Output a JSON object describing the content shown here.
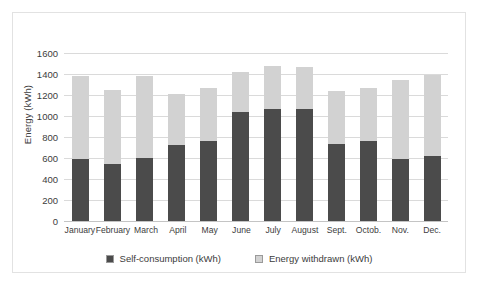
{
  "chart_data": {
    "type": "bar",
    "stacked": true,
    "title": "",
    "xlabel": "",
    "ylabel": "Energy (kWh)",
    "ylim": [
      0,
      1600
    ],
    "ytick_step": 200,
    "yticks": [
      1600,
      1400,
      1200,
      1000,
      800,
      600,
      400,
      200,
      0
    ],
    "grid": "horizontal",
    "legend_position": "bottom",
    "categories": [
      "January",
      "February",
      "March",
      "April",
      "May",
      "June",
      "July",
      "August",
      "Sept.",
      "Octob.",
      "Nov.",
      "Dec."
    ],
    "series": [
      {
        "name": "Self-consumption (kWh)",
        "color": "#4b4b4b",
        "values": [
          590,
          540,
          600,
          720,
          760,
          1040,
          1070,
          1065,
          730,
          760,
          590,
          620
        ]
      },
      {
        "name": "Energy withdrawn (kWh)",
        "color": "#d2d2d2",
        "values": [
          790,
          705,
          785,
          490,
          505,
          380,
          405,
          405,
          510,
          505,
          755,
          770
        ]
      }
    ],
    "totals": [
      1380,
      1245,
      1385,
      1210,
      1265,
      1420,
      1475,
      1470,
      1240,
      1265,
      1345,
      1390
    ]
  }
}
